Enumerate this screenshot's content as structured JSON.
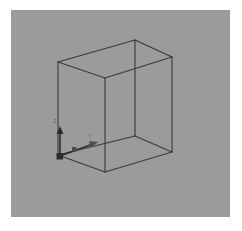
{
  "viewport": {
    "background_color": "#9b9b9b",
    "page_background_color": "#ffffff",
    "label": "3D viewport"
  },
  "scene": {
    "object_name": "cube",
    "wireframe_color": "#3a3a3a",
    "wireframe_width": 1.1,
    "vertices": {
      "front_top_left": [
        47,
        52
      ],
      "front_top_mid": [
        94,
        68
      ],
      "back_top_mid": [
        124,
        30
      ],
      "back_top_right": [
        161,
        47
      ],
      "front_bottom_left": [
        47,
        145
      ],
      "front_bottom_mid": [
        94,
        162
      ],
      "back_bottom_mid": [
        124,
        126
      ],
      "back_bottom_right": [
        161,
        142
      ]
    },
    "edges": [
      [
        "front_top_left",
        "front_top_mid"
      ],
      [
        "front_top_mid",
        "back_top_right"
      ],
      [
        "back_top_right",
        "back_top_mid"
      ],
      [
        "back_top_mid",
        "front_top_left"
      ],
      [
        "front_bottom_left",
        "front_bottom_mid"
      ],
      [
        "front_bottom_mid",
        "back_bottom_right"
      ],
      [
        "back_bottom_right",
        "back_bottom_mid"
      ],
      [
        "back_bottom_mid",
        "front_bottom_left"
      ],
      [
        "front_top_left",
        "front_bottom_left"
      ],
      [
        "front_top_mid",
        "front_bottom_mid"
      ],
      [
        "back_top_right",
        "back_bottom_right"
      ],
      [
        "back_top_mid",
        "back_bottom_mid"
      ]
    ]
  },
  "axis_gizmo": {
    "origin": [
      49,
      146
    ],
    "color": "#2c2c2c",
    "label_color": "#5e5e5e",
    "axes": [
      {
        "name": "z-axis",
        "label": "Z",
        "direction": "up",
        "tip": [
          49,
          118
        ],
        "label_pos": [
          45,
          114
        ]
      },
      {
        "name": "y-axis",
        "label": "Y",
        "direction": "right-upward",
        "tip": [
          85,
          133
        ],
        "label_pos": [
          80,
          128
        ]
      }
    ],
    "origin_handle": {
      "name": "origin-handle",
      "shape": "square",
      "size": 6,
      "color": "#2c2c2c"
    },
    "mid_handle": {
      "name": "axis-mid-handle",
      "shape": "square",
      "size": 4,
      "pos": [
        63,
        139
      ],
      "color": "#4a4a4a"
    }
  }
}
